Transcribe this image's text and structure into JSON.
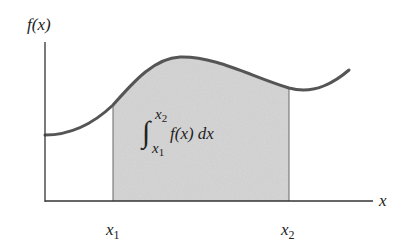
{
  "diagram": {
    "y_axis_label": "f(x)",
    "x_axis_label": "x",
    "x1_label": "x",
    "x1_sub": "1",
    "x2_label": "x",
    "x2_sub": "2",
    "integral": {
      "sign": "∫",
      "upper": "x",
      "upper_sub": "2",
      "lower": "x",
      "lower_sub": "1",
      "integrand": "f(x) dx"
    },
    "colors": {
      "curve": "#555555",
      "shade": "#d4d4d4",
      "axis": "#333333",
      "background": "#ffffff"
    }
  }
}
